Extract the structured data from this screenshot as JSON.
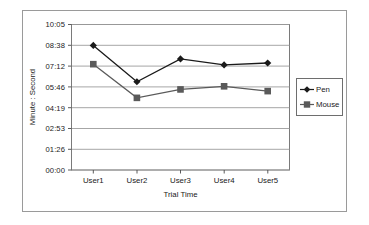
{
  "chart_data": {
    "type": "line",
    "title": "",
    "xlabel": "Trial Time",
    "ylabel": "Minute : Second",
    "categories": [
      "User1",
      "User2",
      "User3",
      "User4",
      "User5"
    ],
    "ytick_labels": [
      "10:05",
      "08:38",
      "07:12",
      "05:46",
      "04:19",
      "02:53",
      "01:26",
      "00:00"
    ],
    "ytick_seconds": [
      605,
      518,
      432,
      346,
      259,
      173,
      86,
      0
    ],
    "ylim_seconds": [
      0,
      605
    ],
    "grid": "horizontal",
    "legend_position": "right",
    "series": [
      {
        "name": "Pen",
        "marker": "diamond",
        "color": "#1a1a1a",
        "values": [
          "08:38",
          "06:07",
          "07:42",
          "07:17",
          "07:25"
        ],
        "values_seconds": [
          518,
          367,
          462,
          437,
          445
        ]
      },
      {
        "name": "Mouse",
        "marker": "square",
        "color": "#5a5a5a",
        "values": [
          "07:20",
          "05:00",
          "05:35",
          "05:48",
          "05:28"
        ],
        "values_seconds": [
          440,
          300,
          335,
          348,
          328
        ]
      }
    ]
  },
  "axes": {
    "y_title": "Minute : Second",
    "x_title": "Trial Time",
    "y_ticks": [
      {
        "label": "10:05"
      },
      {
        "label": "08:38"
      },
      {
        "label": "07:12"
      },
      {
        "label": "05:46"
      },
      {
        "label": "04:19"
      },
      {
        "label": "02:53"
      },
      {
        "label": "01:26"
      },
      {
        "label": "00:00"
      }
    ],
    "x_ticks": [
      {
        "label": "User1"
      },
      {
        "label": "User2"
      },
      {
        "label": "User3"
      },
      {
        "label": "User4"
      },
      {
        "label": "User5"
      }
    ]
  },
  "legend": {
    "items": [
      {
        "label": "Pen",
        "marker": "diamond-marker-icon",
        "color": "#1a1a1a"
      },
      {
        "label": "Mouse",
        "marker": "square-marker-icon",
        "color": "#5a5a5a"
      }
    ]
  },
  "style": {
    "plot_border": "#7a7a7a",
    "gridline": "#9c9c9c",
    "frame": "#9a9a9a",
    "pen_color": "#1a1a1a",
    "mouse_color": "#5a5a5a"
  }
}
